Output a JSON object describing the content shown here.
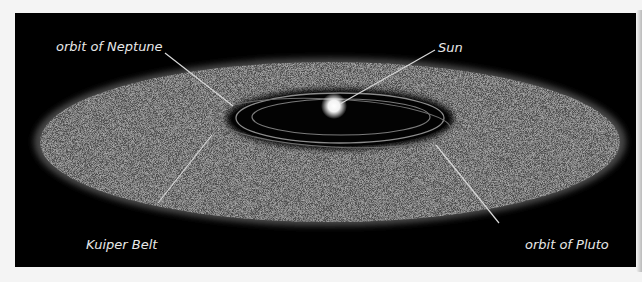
{
  "diagram": {
    "type": "solar-system-outer-region",
    "labels": {
      "neptune": "orbit of  Neptune",
      "sun": "Sun",
      "kuiper": "Kuiper Belt",
      "pluto": "orbit of Pluto"
    },
    "colors": {
      "background": "#000000",
      "belt": "#5a5a5a",
      "orbit_lines": "#8c8c8c",
      "leader_lines": "#d8d8d8",
      "text": "#e8e8e8",
      "sun": "#ffffff"
    }
  }
}
